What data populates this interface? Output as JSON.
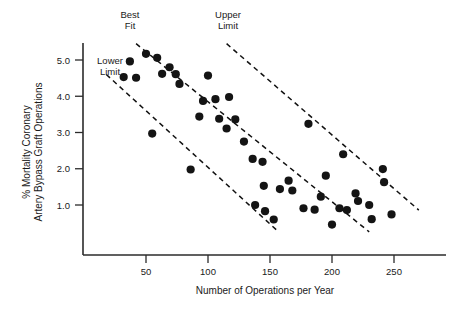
{
  "chart_data": {
    "type": "scatter",
    "title": "",
    "xlabel": "Number of Operations per Year",
    "ylabel_line1": "% Mortality Coronary",
    "ylabel_line2": "Artery Bypass Graft Operations",
    "xlim": [
      20,
      268
    ],
    "ylim": [
      0.2,
      5.45
    ],
    "xticks": [
      50,
      100,
      150,
      200,
      250
    ],
    "xtick_labels": [
      "50",
      "100",
      "150",
      "200",
      "250"
    ],
    "yticks": [
      1.0,
      2.0,
      3.0,
      4.0,
      5.0
    ],
    "ytick_labels": [
      "1.0",
      "2.0",
      "3.0",
      "4.0",
      "5.0"
    ],
    "grid": false,
    "legend": "none",
    "marker_color": "#141414",
    "line_color": "#111111",
    "axis_color": "#2b2b2b",
    "points": [
      {
        "x": 32,
        "y": 4.53
      },
      {
        "x": 37,
        "y": 4.96
      },
      {
        "x": 42,
        "y": 4.51
      },
      {
        "x": 50,
        "y": 5.17
      },
      {
        "x": 55,
        "y": 2.97
      },
      {
        "x": 59,
        "y": 5.06
      },
      {
        "x": 63,
        "y": 4.62
      },
      {
        "x": 69,
        "y": 4.8
      },
      {
        "x": 74,
        "y": 4.61
      },
      {
        "x": 77,
        "y": 4.34
      },
      {
        "x": 86,
        "y": 1.98
      },
      {
        "x": 93,
        "y": 3.44
      },
      {
        "x": 96,
        "y": 3.87
      },
      {
        "x": 100,
        "y": 4.57
      },
      {
        "x": 106,
        "y": 3.92
      },
      {
        "x": 109,
        "y": 3.38
      },
      {
        "x": 115,
        "y": 3.11
      },
      {
        "x": 117,
        "y": 3.98
      },
      {
        "x": 122,
        "y": 3.36
      },
      {
        "x": 129,
        "y": 2.75
      },
      {
        "x": 136,
        "y": 2.27
      },
      {
        "x": 138,
        "y": 1.0
      },
      {
        "x": 144,
        "y": 2.19
      },
      {
        "x": 145,
        "y": 1.53
      },
      {
        "x": 146,
        "y": 0.83
      },
      {
        "x": 153,
        "y": 0.6
      },
      {
        "x": 158,
        "y": 1.44
      },
      {
        "x": 165,
        "y": 1.67
      },
      {
        "x": 168,
        "y": 1.4
      },
      {
        "x": 177,
        "y": 0.91
      },
      {
        "x": 181,
        "y": 3.24
      },
      {
        "x": 186,
        "y": 0.87
      },
      {
        "x": 191,
        "y": 1.23
      },
      {
        "x": 195,
        "y": 1.81
      },
      {
        "x": 200,
        "y": 0.46
      },
      {
        "x": 206,
        "y": 0.91
      },
      {
        "x": 209,
        "y": 2.4
      },
      {
        "x": 212,
        "y": 0.86
      },
      {
        "x": 219,
        "y": 1.32
      },
      {
        "x": 221,
        "y": 1.11
      },
      {
        "x": 230,
        "y": 1.0
      },
      {
        "x": 232,
        "y": 0.61
      },
      {
        "x": 241,
        "y": 1.99
      },
      {
        "x": 242,
        "y": 1.63
      },
      {
        "x": 248,
        "y": 0.74
      }
    ],
    "trend_lines": [
      {
        "name": "Best Fit",
        "label_line1": "Best",
        "label_line2": "Fit",
        "x_start": 42,
        "y_start": 5.45,
        "x_end": 230,
        "y_end": 0.26,
        "style": "dashed"
      },
      {
        "name": "Upper Limit",
        "label_line1": "Upper",
        "label_line2": "Limit",
        "x_start": 115,
        "y_start": 5.45,
        "x_end": 270,
        "y_end": 0.86,
        "style": "dashed"
      },
      {
        "name": "Lower Limit",
        "label_line1": "Lower",
        "label_line2": "Limit",
        "x_start": 18,
        "y_start": 4.6,
        "x_end": 155,
        "y_end": 0.32,
        "style": "dashed"
      }
    ],
    "annotations": [
      {
        "name": "best-fit",
        "text_line1": "Best",
        "text_line2": "Fit",
        "px": 130,
        "py": 18
      },
      {
        "name": "upper-limit",
        "text_line1": "Upper",
        "text_line2": "Limit",
        "px": 228,
        "py": 18
      },
      {
        "name": "lower-limit",
        "text_line1": "Lower",
        "text_line2": "Limit",
        "px": 110,
        "py": 64
      }
    ]
  }
}
